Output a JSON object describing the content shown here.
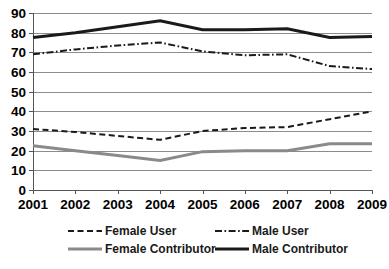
{
  "chart_data": {
    "type": "line",
    "title": "",
    "xlabel": "",
    "ylabel": "",
    "categories": [
      "2001",
      "2002",
      "2003",
      "2004",
      "2005",
      "2006",
      "2007",
      "2008",
      "2009"
    ],
    "x": [
      2001,
      2002,
      2003,
      2004,
      2005,
      2006,
      2007,
      2008,
      2009
    ],
    "ylim": [
      0,
      90
    ],
    "yticks": [
      0,
      10,
      20,
      30,
      40,
      50,
      60,
      70,
      80,
      90
    ],
    "ytick_labels": [
      "0",
      "10",
      "20",
      "30",
      "40",
      "50",
      "60",
      "70",
      "80",
      "90"
    ],
    "grid": true,
    "legend_position": "bottom",
    "series": [
      {
        "name": "Female User",
        "style": "dashed",
        "color": "#1a1a1a",
        "values": [
          31,
          29.5,
          27.5,
          25.5,
          30,
          31.5,
          32,
          36,
          40
        ]
      },
      {
        "name": "Male User",
        "style": "dash-dot",
        "color": "#1a1a1a",
        "values": [
          69,
          71.5,
          73.5,
          75,
          70.5,
          68.5,
          69,
          63,
          61.5
        ]
      },
      {
        "name": "Female Contributor",
        "style": "solid",
        "color": "#8a8a8a",
        "values": [
          22.5,
          20,
          17.5,
          15,
          19.5,
          20,
          20,
          23.5,
          23.5
        ]
      },
      {
        "name": "Male Contributor",
        "style": "solid",
        "color": "#1a1a1a",
        "values": [
          77.5,
          80,
          83,
          86,
          81.5,
          81.5,
          82,
          77.5,
          78
        ]
      }
    ]
  },
  "legend": {
    "items": [
      {
        "label": "Female User",
        "swatch": "dashed-line-swatch"
      },
      {
        "label": "Male User",
        "swatch": "dash-dot-line-swatch"
      },
      {
        "label": "Female Contributor",
        "swatch": "gray-solid-line-swatch"
      },
      {
        "label": "Male Contributor",
        "swatch": "black-solid-line-swatch"
      }
    ]
  }
}
